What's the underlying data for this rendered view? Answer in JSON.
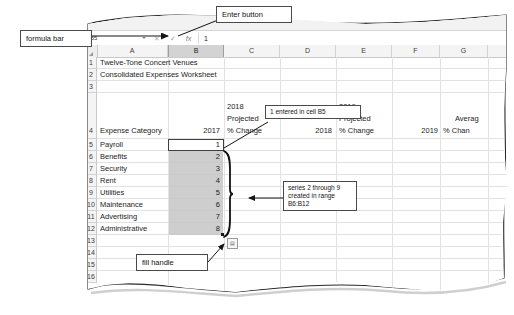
{
  "ribbon": {
    "themes_label": "Themes"
  },
  "formula_bar": {
    "name_box_value": "B5",
    "cancel_icon": "cancel-x-icon",
    "enter_icon": "enter-check-icon",
    "function_icon": "insert-function-fx-icon",
    "value": "1"
  },
  "callouts": [
    {
      "id": "formula-bar",
      "text": "formula bar"
    },
    {
      "id": "enter-button",
      "text": "Enter button"
    },
    {
      "id": "entered-in-b5",
      "text": "1 entered in cell B5"
    },
    {
      "id": "series-created",
      "text": "series 2 through 9 created in range B6:B12"
    },
    {
      "id": "fill-handle",
      "text": "fill handle"
    }
  ],
  "worksheet": {
    "columns": [
      "A",
      "B",
      "C",
      "D",
      "E",
      "F",
      "G"
    ],
    "selected_column": "B",
    "rows": [
      "1",
      "2",
      "3",
      "4",
      "5",
      "6",
      "7",
      "8",
      "9",
      "10",
      "11",
      "12",
      "13",
      "14",
      "15",
      "16"
    ],
    "cells": {
      "A1": "Twelve-Tone Concert Venues",
      "A2": "Consolidated Expenses Worksheet",
      "A4": "Expense Category",
      "B4": "2017",
      "C4_line1": "2018",
      "C4_line2": "Projected",
      "C4_line3": "% Change",
      "D4": "2018",
      "E4_line1": "2019",
      "E4_line2": "Projected",
      "E4_line3": "% Change",
      "F4": "2019",
      "G4_line1": "Averag",
      "G4_line2": "% Chan",
      "A5": "Payroll",
      "A6": "Benefits",
      "A7": "Security",
      "A8": "Rent",
      "A9": "Utilities",
      "A10": "Maintenance",
      "A11": "Advertising",
      "A12": "Administrative",
      "B5": "1",
      "B6": "2",
      "B7": "3",
      "B8": "4",
      "B9": "5",
      "B10": "6",
      "B11": "7",
      "B12": "8"
    },
    "autofill_options_icon": "autofill-options-icon",
    "active_cell": "B5",
    "fill_range": "B6:B12"
  }
}
